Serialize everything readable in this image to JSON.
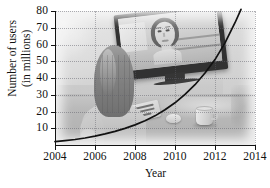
{
  "photo": {
    "scene_name": "video-chat-photo",
    "elements": [
      {
        "name": "flat-panel-monitor"
      },
      {
        "name": "person-on-screen"
      },
      {
        "name": "woman-seated-back-view"
      },
      {
        "name": "keyboard"
      },
      {
        "name": "computer-mouse"
      },
      {
        "name": "coffee-mug"
      },
      {
        "name": "desk"
      }
    ]
  },
  "chart_data": {
    "type": "line",
    "title": "",
    "subtitle": "",
    "xlabel": "Year",
    "ylabel": "Number of users\n(in millions)",
    "ylabel_line1": "Number of users",
    "ylabel_line2": "(in millions)",
    "xlim": [
      2004,
      2014
    ],
    "ylim": [
      0,
      80
    ],
    "xticks": [
      2004,
      2006,
      2008,
      2010,
      2012,
      2014
    ],
    "xtick_labels": [
      "2004",
      "2006",
      "2008",
      "2010",
      "2012",
      "2014"
    ],
    "yticks": [
      10,
      20,
      30,
      40,
      50,
      60,
      70,
      80
    ],
    "ytick_labels": [
      "10",
      "20",
      "30",
      "40",
      "50",
      "60",
      "70",
      "80"
    ],
    "grid": true,
    "grid_style": "dotted",
    "legend": null,
    "series": [
      {
        "name": "Number of users (in millions)",
        "color": "#111111",
        "style": "solid",
        "x": [
          2004,
          2004.5,
          2005,
          2005.5,
          2006,
          2006.5,
          2007,
          2007.5,
          2008,
          2008.5,
          2009,
          2009.5,
          2010,
          2010.5,
          2011,
          2011.5,
          2012,
          2012.5,
          2013,
          2013.3
        ],
        "values": [
          2.0,
          2.6,
          3.3,
          4.2,
          5.3,
          6.6,
          8.1,
          9.9,
          12.0,
          14.5,
          17.4,
          21.0,
          25.2,
          30.2,
          36.0,
          43.0,
          51.0,
          61.0,
          73.0,
          81.0
        ]
      }
    ]
  },
  "colors": {
    "curve": "#111111",
    "axis": "#121212",
    "grid": "#5f5f69",
    "page_background": "#ffffff"
  }
}
